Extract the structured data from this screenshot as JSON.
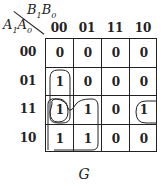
{
  "kmap": {
    "title": "G",
    "row_var": "A1A0",
    "col_var": "B1B0",
    "row_var_parts": {
      "a1": "A",
      "s1": "1",
      "a0": "A",
      "s0": "0"
    },
    "col_var_parts": {
      "b1": "B",
      "s1": "1",
      "b0": "B",
      "s0": "0"
    },
    "col_headers": [
      "00",
      "01",
      "11",
      "10"
    ],
    "row_headers": [
      "00",
      "01",
      "11",
      "10"
    ],
    "cells": [
      [
        "0",
        "0",
        "0",
        "0"
      ],
      [
        "1",
        "0",
        "0",
        "0"
      ],
      [
        "1",
        "1",
        "0",
        "1"
      ],
      [
        "1",
        "1",
        "0",
        "0"
      ]
    ],
    "groupings": [
      {
        "cells": "rows 01-11, col 00",
        "shape": "vertical pair"
      },
      {
        "cells": "rows 11-10, cols 00-01",
        "shape": "quad"
      },
      {
        "cells": "row 11, cols 00 & 10 (wrap-around)",
        "shape": "edge pair"
      }
    ]
  }
}
